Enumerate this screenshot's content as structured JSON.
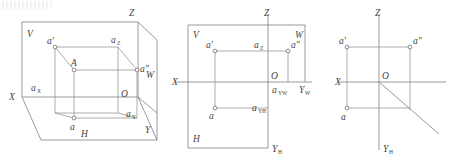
{
  "figure": {
    "stroke_color": "#808080",
    "label_color": "#3f3f3f",
    "point_fill": "#ffffff"
  },
  "panel_left": {
    "name": "axonometric-three-plane-view",
    "labels": {
      "plane_v": "V",
      "plane_h": "H",
      "plane_w": "W",
      "axis_x": "X",
      "axis_y": "Y",
      "axis_z": "Z",
      "origin": "O",
      "point_space": "A",
      "proj_front": "a'",
      "proj_horizontal": "a",
      "proj_profile": "a″",
      "foot_x": "a",
      "foot_x_sub": "X",
      "foot_y": "a",
      "foot_y_sub": "Y",
      "foot_z": "a",
      "foot_z_sub": "Z"
    }
  },
  "panel_middle": {
    "name": "unfolded-projection-layout",
    "labels": {
      "plane_v": "V",
      "plane_h": "H",
      "plane_w": "W",
      "axis_x": "X",
      "axis_z": "Z",
      "axis_yw": "Y",
      "axis_yw_sub": "W",
      "axis_yh": "Y",
      "axis_yh_sub": "H",
      "origin": "O",
      "proj_front": "a'",
      "proj_horizontal": "a",
      "proj_profile": "a″",
      "foot_z": "a",
      "foot_z_sub": "Z",
      "foot_yw": "a",
      "foot_yw_sub": "YW",
      "foot_yh": "a",
      "foot_yh_sub": "YH"
    }
  },
  "panel_right": {
    "name": "axis-only-projection-with-bisector",
    "labels": {
      "axis_x": "X",
      "axis_z": "Z",
      "axis_yh": "Y",
      "axis_yh_sub": "H",
      "origin": "O",
      "proj_front": "a'",
      "proj_horizontal": "a",
      "proj_profile": "a″"
    }
  }
}
